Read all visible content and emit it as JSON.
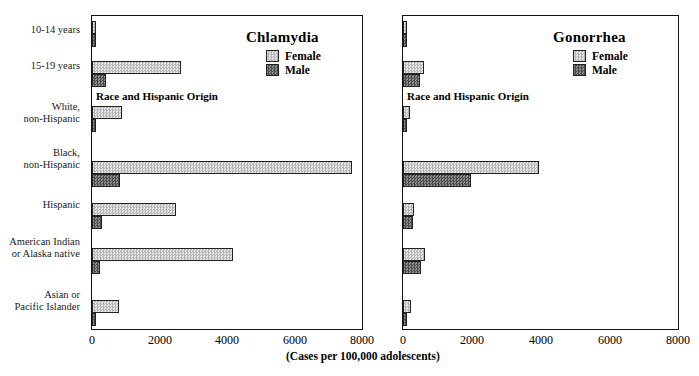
{
  "top_cropped_text": "",
  "axis_caption": "(Cases per 100,000 adolescents)",
  "categories": [
    "10-14 years",
    "15-19 years",
    "White,\nnon-Hispanic",
    "Black,\nnon-Hispanic",
    "Hispanic",
    "American Indian\nor Alaska native",
    "Asian or\nPacific Islander"
  ],
  "group_heading": "Race and Hispanic Origin",
  "xticks": [
    "0",
    "2000",
    "4000",
    "6000",
    "8000"
  ],
  "legend": {
    "female_label": "Female",
    "male_label": "Male"
  },
  "colors": {
    "female_fill": "#c9c9c9",
    "male_fill": "#6d6d6d",
    "axis": "#111111",
    "text": "#000000"
  },
  "chart_data": [
    {
      "type": "bar",
      "title": "Chlamydia",
      "orientation": "horizontal",
      "grouped": true,
      "xlabel": "(Cases per 100,000 adolescents)",
      "ylabel": "",
      "xlim": [
        0,
        8000
      ],
      "xticks": [
        0,
        2000,
        4000,
        6000,
        8000
      ],
      "grid": false,
      "legend_position": "top-right",
      "categories": [
        "10-14 years",
        "15-19 years",
        "White, non-Hispanic",
        "Black, non-Hispanic",
        "Hispanic",
        "American Indian or Alaska native",
        "Asian or Pacific Islander"
      ],
      "series": [
        {
          "name": "Female",
          "values": [
            115,
            2640,
            890,
            7700,
            2480,
            4170,
            790
          ]
        },
        {
          "name": "Male",
          "values": [
            20,
            400,
            130,
            840,
            300,
            230,
            90
          ]
        }
      ]
    },
    {
      "type": "bar",
      "title": "Gonorrhea",
      "orientation": "horizontal",
      "grouped": true,
      "xlabel": "(Cases per 100,000 adolescents)",
      "ylabel": "",
      "xlim": [
        0,
        8000
      ],
      "xticks": [
        0,
        2000,
        4000,
        6000,
        8000
      ],
      "grid": false,
      "legend_position": "top-right",
      "categories": [
        "10-14 years",
        "15-19 years",
        "White, non-Hispanic",
        "Black, non-Hispanic",
        "Hispanic",
        "American Indian or Alaska native",
        "Asian or Pacific Islander"
      ],
      "series": [
        {
          "name": "Female",
          "values": [
            70,
            620,
            210,
            3950,
            330,
            640,
            230
          ]
        },
        {
          "name": "Male",
          "values": [
            25,
            500,
            110,
            1980,
            300,
            520,
            90
          ]
        }
      ]
    }
  ]
}
